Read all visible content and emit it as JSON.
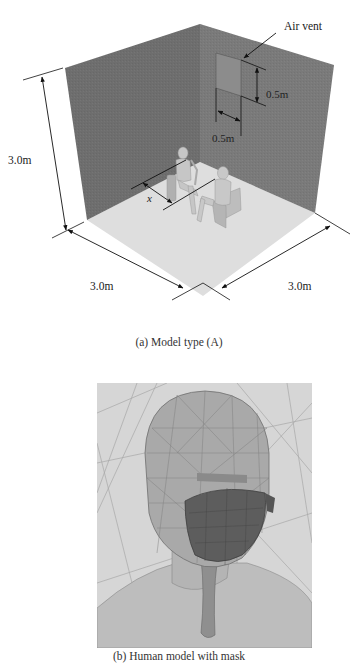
{
  "figure_a": {
    "caption": "(a) Model type (A)",
    "labels": {
      "air_vent": "Air vent",
      "vent_height": "0.5m",
      "vent_width": "0.5m",
      "room_height": "3.0m",
      "room_depth_left": "3.0m",
      "room_depth_right": "3.0m",
      "distance": "x"
    },
    "colors": {
      "left_wall": "#6e6e6e",
      "right_wall": "#7a7a7a",
      "floor": "#dcdcdc",
      "vent": "#8a8a8a"
    }
  },
  "figure_b": {
    "caption": "(b) Human model with mask"
  }
}
